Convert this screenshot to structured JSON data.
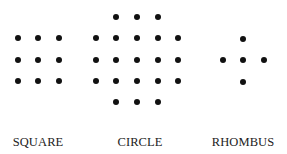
{
  "figures": [
    {
      "label": "SQUARE",
      "label_x": 38,
      "dots": [
        [
          18,
          38
        ],
        [
          38,
          38
        ],
        [
          59,
          38
        ],
        [
          18,
          60
        ],
        [
          38,
          60
        ],
        [
          59,
          60
        ],
        [
          18,
          81
        ],
        [
          38,
          81
        ],
        [
          59,
          81
        ]
      ]
    },
    {
      "label": "CIRCLE",
      "label_x": 140,
      "dots": [
        [
          116,
          17
        ],
        [
          137,
          17
        ],
        [
          158,
          17
        ],
        [
          96,
          38
        ],
        [
          116,
          38
        ],
        [
          137,
          38
        ],
        [
          158,
          38
        ],
        [
          178,
          38
        ],
        [
          96,
          60
        ],
        [
          116,
          60
        ],
        [
          137,
          60
        ],
        [
          158,
          60
        ],
        [
          178,
          60
        ],
        [
          96,
          81
        ],
        [
          116,
          81
        ],
        [
          137,
          81
        ],
        [
          158,
          81
        ],
        [
          178,
          81
        ],
        [
          116,
          102
        ],
        [
          137,
          102
        ],
        [
          158,
          102
        ]
      ]
    },
    {
      "label": "RHOMBUS",
      "label_x": 243,
      "dots": [
        [
          243,
          39
        ],
        [
          223,
          60
        ],
        [
          243,
          60
        ],
        [
          264,
          60
        ],
        [
          243,
          82
        ]
      ]
    }
  ]
}
